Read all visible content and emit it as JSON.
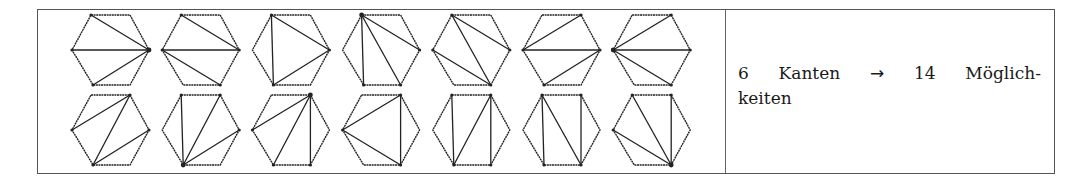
{
  "figure": {
    "vertex_order": [
      "TL",
      "TR",
      "R",
      "BR",
      "BL",
      "L"
    ],
    "rows": [
      {
        "hexagons": [
          {
            "diagonals": [
              [
                "R",
                "TL"
              ],
              [
                "R",
                "L"
              ],
              [
                "R",
                "BL"
              ]
            ],
            "fan_vertex": "R"
          },
          {
            "diagonals": [
              [
                "TL",
                "R"
              ],
              [
                "L",
                "R"
              ],
              [
                "L",
                "BR"
              ]
            ]
          },
          {
            "diagonals": [
              [
                "TL",
                "BL"
              ],
              [
                "TL",
                "R"
              ],
              [
                "BL",
                "R"
              ]
            ]
          },
          {
            "diagonals": [
              [
                "TL",
                "BL"
              ],
              [
                "TL",
                "BR"
              ],
              [
                "TL",
                "R"
              ]
            ],
            "fan_vertex": "TL"
          },
          {
            "diagonals": [
              [
                "TL",
                "R"
              ],
              [
                "TL",
                "BR"
              ],
              [
                "L",
                "BR"
              ]
            ]
          },
          {
            "diagonals": [
              [
                "L",
                "TR"
              ],
              [
                "L",
                "R"
              ],
              [
                "R",
                "BL"
              ]
            ]
          },
          {
            "diagonals": [
              [
                "L",
                "TR"
              ],
              [
                "L",
                "R"
              ],
              [
                "L",
                "BR"
              ]
            ],
            "fan_vertex": "L"
          }
        ]
      },
      {
        "hexagons": [
          {
            "diagonals": [
              [
                "L",
                "TR"
              ],
              [
                "TR",
                "BL"
              ],
              [
                "BL",
                "R"
              ]
            ]
          },
          {
            "diagonals": [
              [
                "BL",
                "TL"
              ],
              [
                "BL",
                "TR"
              ],
              [
                "BL",
                "R"
              ]
            ],
            "fan_vertex": "BL"
          },
          {
            "diagonals": [
              [
                "TR",
                "L"
              ],
              [
                "TR",
                "BL"
              ],
              [
                "TR",
                "BR"
              ]
            ],
            "fan_vertex": "TR"
          },
          {
            "diagonals": [
              [
                "L",
                "TR"
              ],
              [
                "L",
                "BR"
              ],
              [
                "TR",
                "BR"
              ]
            ]
          },
          {
            "diagonals": [
              [
                "TL",
                "BL"
              ],
              [
                "TR",
                "BL"
              ],
              [
                "TR",
                "BR"
              ]
            ]
          },
          {
            "diagonals": [
              [
                "TL",
                "BL"
              ],
              [
                "TL",
                "BR"
              ],
              [
                "TR",
                "BR"
              ]
            ]
          },
          {
            "diagonals": [
              [
                "BR",
                "TL"
              ],
              [
                "BR",
                "TR"
              ],
              [
                "BR",
                "L"
              ]
            ],
            "fan_vertex": "BR"
          }
        ]
      }
    ]
  },
  "caption": {
    "count_edges": "6",
    "word_edges": "Kanten",
    "arrow": "→",
    "count_options": "14",
    "word_options_part1": "Möglich-",
    "word_options_part2": "keiten"
  },
  "colors": {
    "line": "#222222",
    "border": "#555555"
  }
}
